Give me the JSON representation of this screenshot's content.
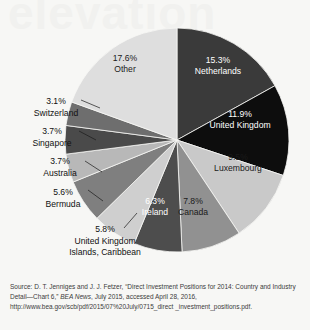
{
  "figure": {
    "watermark_text": "elevation",
    "background_color": "#f7f7f5"
  },
  "chart_data": {
    "type": "pie",
    "title": "",
    "subtitle": "",
    "xlabel": "",
    "ylabel": "",
    "legend_position": "labels-on-slices",
    "grid": false,
    "center": {
      "x": 177,
      "y": 140
    },
    "radius": 112,
    "start_angle_deg": -90,
    "direction": "clockwise",
    "categories": [
      "Netherlands",
      "United Kingdom",
      "Luxembourg",
      "Canada",
      "Ireland",
      "United Kingdom Islands, Caribbean",
      "Bermuda",
      "Australia",
      "Singapore",
      "Switzerland",
      "Other"
    ],
    "values": [
      15.3,
      11.9,
      9.5,
      7.8,
      6.3,
      5.8,
      5.6,
      3.7,
      3.7,
      3.1,
      17.6
    ],
    "value_labels": [
      "15.3%",
      "11.9%",
      "9.5%",
      "7.8%",
      "6.3%",
      "5.8%",
      "5.6%",
      "3.7%",
      "3.7%",
      "3.1%",
      "17.6%"
    ],
    "unit": "%",
    "colors": [
      "#3a3a3a",
      "#0d0d0d",
      "#c9c9c9",
      "#919191",
      "#4d4d4d",
      "#cfcfcf",
      "#7f7f7f",
      "#b8b8b8",
      "#4a4a4a",
      "#6e6e6e",
      "#dedede"
    ],
    "label_text_colors": [
      "#ffffff",
      "#ffffff",
      "#1a1a1a",
      "#1a1a1a",
      "#ffffff",
      "#1a1a1a",
      "#1a1a1a",
      "#1a1a1a",
      "#1a1a1a",
      "#1a1a1a",
      "#1a1a1a"
    ],
    "label_placement": [
      "inside",
      "inside",
      "inside",
      "inside",
      "inside",
      "outside",
      "outside",
      "outside",
      "outside",
      "outside",
      "inside"
    ]
  },
  "slice_labels_inside": [
    {
      "name": "netherlands",
      "pct": "15.3%",
      "label": "Netherlands",
      "x": 218,
      "y": 63,
      "tone": "light"
    },
    {
      "name": "united-kingdom",
      "pct": "11.9%",
      "label": "United Kingdom",
      "x": 240,
      "y": 117,
      "tone": "light"
    },
    {
      "name": "luxembourg",
      "pct": "9.5%",
      "label": "Luxembourg",
      "x": 238,
      "y": 160,
      "tone": "dark"
    },
    {
      "name": "canada",
      "pct": "7.8%",
      "label": "Canada",
      "x": 193,
      "y": 204,
      "tone": "dark"
    },
    {
      "name": "ireland",
      "pct": "6.3%",
      "label": "Ireland",
      "x": 155,
      "y": 204,
      "tone": "light"
    },
    {
      "name": "other",
      "pct": "17.6%",
      "label": "Other",
      "x": 125,
      "y": 61,
      "tone": "dark"
    }
  ],
  "outer_labels": [
    {
      "name": "switzerland",
      "pct": "3.1%",
      "lines": [
        "Switzerland"
      ],
      "pct_x": 56,
      "pct_y": 104,
      "line_x": 56,
      "line_y": 118,
      "anchor": "middle",
      "leader": {
        "x1": 81,
        "y1": 100,
        "x2": 100,
        "y2": 108
      }
    },
    {
      "name": "singapore",
      "pct": "3.7%",
      "lines": [
        "Singapore"
      ],
      "pct_x": 52,
      "pct_y": 134,
      "line_x": 52,
      "line_y": 148,
      "anchor": "middle",
      "leader": {
        "x1": 79,
        "y1": 131,
        "x2": 96,
        "y2": 140
      }
    },
    {
      "name": "australia",
      "pct": "3.7%",
      "lines": [
        "Australia"
      ],
      "pct_x": 60,
      "pct_y": 164,
      "line_x": 60,
      "line_y": 178,
      "anchor": "middle",
      "leader": {
        "x1": 85,
        "y1": 161,
        "x2": 102,
        "y2": 172
      }
    },
    {
      "name": "bermuda",
      "pct": "5.6%",
      "lines": [
        "Bermuda"
      ],
      "pct_x": 63,
      "pct_y": 195,
      "line_x": 63,
      "line_y": 209,
      "anchor": "middle",
      "leader": {
        "x1": 88,
        "y1": 190,
        "x2": 103,
        "y2": 201
      }
    },
    {
      "name": "united-kingdom-islands-caribbean",
      "pct": "5.8%",
      "lines": [
        "United Kingdom",
        "Islands, Caribbean"
      ],
      "pct_x": 105,
      "pct_y": 232,
      "line_x": 105,
      "line_y": 246,
      "anchor": "middle",
      "leader": {
        "x1": 124,
        "y1": 228,
        "x2": 137,
        "y2": 213
      }
    }
  ],
  "source": {
    "prefix": "Source: D. T. Jenniges and J. J. Fetzer, “Direct Investment Positions for 2014: Country and Industry Detail—Chart 6,” ",
    "italic": "BEA News",
    "suffix": ", July 2015, accessed April 28, 2016, http://www.bea.gov/scb/pdf/2015/07%20July/0715_direct _investment_positions.pdf."
  }
}
